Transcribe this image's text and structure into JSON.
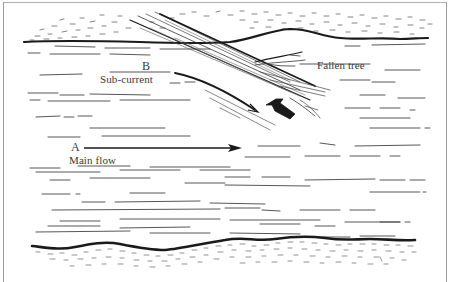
{
  "diagram": {
    "type": "river-flow-illustration",
    "labels": {
      "point_a": "A",
      "point_b": "B",
      "main_flow": "Main flow",
      "sub_current": "Sub-current",
      "fallen_tree": "Fallen tree"
    },
    "colors": {
      "ink": "#1a1a1a",
      "faint_ink": "#555555",
      "frame": "#9a9a9a",
      "background": "#ffffff"
    },
    "arrows": [
      {
        "name": "main-flow-arrow",
        "from": "A",
        "direction": "right"
      },
      {
        "name": "sub-current-arrow",
        "from": "B",
        "direction": "down-right"
      },
      {
        "name": "eddy-arrow",
        "direction": "up-left"
      }
    ]
  }
}
